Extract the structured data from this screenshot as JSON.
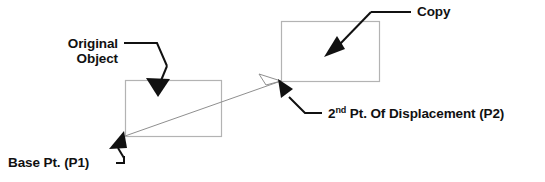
{
  "diagram": {
    "labels": {
      "original_object_line1": "Original",
      "original_object_line2": "Object",
      "copy": "Copy",
      "base_point": "Base Pt. (P1)",
      "second_point_prefix": "2",
      "second_point_superscript": "nd",
      "second_point_rest": " Pt. Of Displacement (P2)"
    },
    "colors": {
      "background": "#ffffff",
      "rectangle_stroke": "#b0b0b0",
      "vector_stroke": "#8a8a8a",
      "leader_stroke": "#111111",
      "arrow_fill": "#111111",
      "text": "#111111"
    },
    "shapes": {
      "original_rect": {
        "x": 125,
        "y": 80,
        "width": 96,
        "height": 56
      },
      "copy_rect": {
        "x": 281,
        "y": 21,
        "width": 98,
        "height": 60
      },
      "base_point": {
        "x": 125,
        "y": 136
      },
      "second_point": {
        "x": 281,
        "y": 81
      },
      "displacement_vector": {
        "x1": 125,
        "y1": 136,
        "x2": 281,
        "y2": 81
      }
    }
  }
}
